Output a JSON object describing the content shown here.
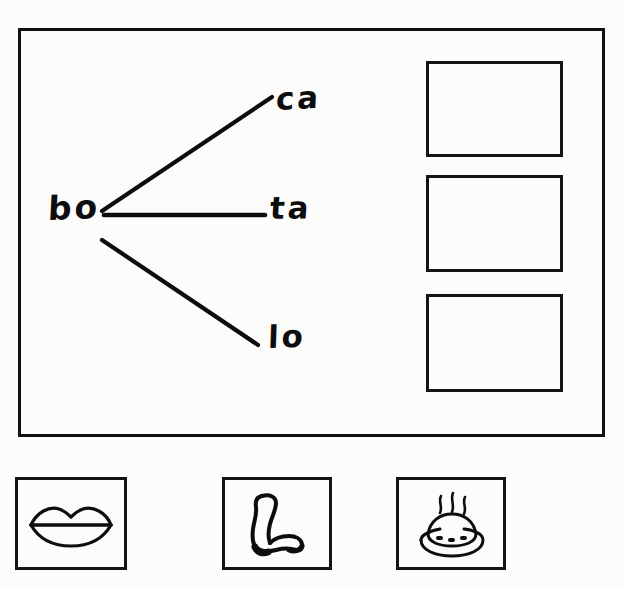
{
  "worksheet": {
    "type": "handwritten-phonics-worksheet",
    "ink_color": "#0d0d0d",
    "paper_color": "#fcfcfb",
    "border_color": "#141414"
  },
  "main_panel": {
    "name": "syllable-matching-panel",
    "root_syllable": {
      "label": "bo",
      "position": {
        "x": 48,
        "y": 192
      }
    },
    "branches": [
      {
        "id": "branch-1",
        "label": "ca",
        "forms_word": "boca",
        "line": {
          "x1": 102,
          "y1": 211,
          "x2": 272,
          "y2": 97
        }
      },
      {
        "id": "branch-2",
        "label": "ta",
        "forms_word": "bota",
        "line": {
          "x1": 104,
          "y1": 215,
          "x2": 265,
          "y2": 215
        }
      },
      {
        "id": "branch-3",
        "label": "lo",
        "forms_word": "bolo",
        "line": {
          "x1": 102,
          "y1": 240,
          "x2": 258,
          "y2": 345
        }
      }
    ],
    "answer_boxes": [
      {
        "id": "answer-box-1",
        "value": "",
        "filled": false
      },
      {
        "id": "answer-box-2",
        "value": "",
        "filled": false
      },
      {
        "id": "answer-box-3",
        "value": "",
        "filled": false
      }
    ]
  },
  "picture_cards": [
    {
      "id": "picture-card-1",
      "icon": "lips-mouth-icon",
      "depicts": "mouth",
      "caption": ""
    },
    {
      "id": "picture-card-2",
      "icon": "boot-icon",
      "depicts": "boot",
      "caption": ""
    },
    {
      "id": "picture-card-3",
      "icon": "cake-icon",
      "depicts": "cake",
      "caption": ""
    }
  ]
}
